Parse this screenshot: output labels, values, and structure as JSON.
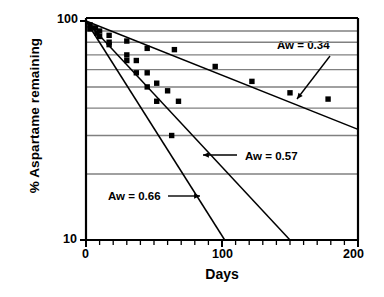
{
  "chart_data": {
    "type": "scatter",
    "title": "",
    "xlabel": "Days",
    "ylabel": "% Aspartame remaining",
    "xlim": [
      0,
      200
    ],
    "ylim": [
      10,
      100
    ],
    "yscale": "log",
    "xscale": "linear",
    "grid": true,
    "grid_axis": "y",
    "x_ticks_major": [
      "0",
      "100",
      "200"
    ],
    "x_tick_major_values": [
      0,
      100,
      200
    ],
    "x_tick_minor_step": 10,
    "y_ticks_major": [
      "100",
      "10"
    ],
    "y_tick_major_values": [
      100,
      10
    ],
    "y_gridline_values": [
      90,
      80,
      70,
      60,
      50,
      40,
      30,
      20
    ],
    "legend_position": "inline-annotations",
    "series": [
      {
        "name": "Aw = 0.34",
        "label": "Aw = 0.34",
        "marker": "square",
        "fit_line": {
          "x": [
            0,
            200
          ],
          "y": [
            100,
            32
          ]
        },
        "x": [
          3,
          7,
          10,
          17,
          30,
          45,
          65,
          95,
          122,
          150,
          178
        ],
        "y": [
          96,
          93,
          90,
          86,
          81,
          75,
          74,
          62,
          53,
          47,
          44
        ]
      },
      {
        "name": "Aw = 0.57",
        "label": "Aw = 0.57",
        "marker": "square",
        "fit_line": {
          "x": [
            0,
            150
          ],
          "y": [
            100,
            10
          ]
        },
        "x": [
          3,
          8,
          17,
          30,
          37,
          45,
          52,
          60,
          68
        ],
        "y": [
          93,
          88,
          80,
          70,
          66,
          58,
          52,
          48,
          43
        ]
      },
      {
        "name": "Aw = 0.66",
        "label": "Aw = 0.66",
        "marker": "square",
        "fit_line": {
          "x": [
            0,
            102
          ],
          "y": [
            100,
            10
          ]
        },
        "x": [
          3,
          10,
          17,
          30,
          37,
          45,
          52,
          63
        ],
        "y": [
          92,
          85,
          78,
          66,
          58,
          50,
          43,
          30
        ]
      }
    ],
    "annotations": [
      {
        "text": "Aw = 0.34",
        "arrow": "down-left",
        "boxed": true
      },
      {
        "text": "Aw = 0.57",
        "arrow": "left",
        "boxed": false
      },
      {
        "text": "Aw = 0.66",
        "arrow": "right",
        "boxed": false
      }
    ],
    "colors": {
      "axis": "#000000",
      "gridline": "#808080",
      "marker": "#000000",
      "fit_line": "#000000",
      "background": "#ffffff"
    }
  }
}
